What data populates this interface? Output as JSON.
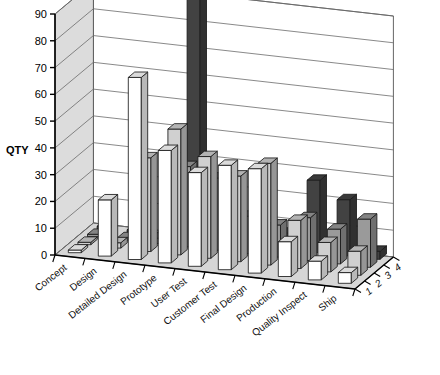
{
  "chart_data": {
    "type": "bar",
    "title": "",
    "subtitle": "",
    "xlabel": "",
    "ylabel": "QTY",
    "zlabel": "",
    "ylim": [
      0,
      90
    ],
    "ytick_step": 10,
    "yticks": [
      0,
      10,
      20,
      30,
      40,
      50,
      60,
      70,
      80,
      90
    ],
    "ytick_labels": [
      "0",
      "10",
      "20",
      "30",
      "40",
      "50",
      "60",
      "70",
      "80",
      "90"
    ],
    "grid": true,
    "legend_position": "none",
    "projection": "3d",
    "categories": [
      "Concept",
      "Design",
      "Detailed Design",
      "Prototype",
      "User Test",
      "Customer Test",
      "Final Design",
      "Production",
      "Quality Inspect",
      "Ship"
    ],
    "series_axis_labels": [
      "1",
      "2",
      "3",
      "4"
    ],
    "series": [
      {
        "name": "1",
        "color": "#ffffff",
        "values": [
          1,
          21,
          68,
          42,
          35,
          39,
          39,
          13,
          7,
          4
        ]
      },
      {
        "name": "2",
        "color": "#d0d0d0",
        "values": [
          0,
          2,
          35,
          47,
          38,
          32,
          38,
          18,
          11,
          9
        ]
      },
      {
        "name": "3",
        "color": "#9a9a9a",
        "values": [
          0,
          0,
          2,
          30,
          27,
          14,
          12,
          16,
          13,
          18
        ]
      },
      {
        "name": "4",
        "color": "#424242",
        "values": [
          0,
          0,
          0,
          90,
          24,
          9,
          6,
          27,
          21,
          3
        ]
      }
    ]
  },
  "axes": {
    "qty_title": "QTY"
  },
  "caption": {
    "text": ""
  },
  "icons": {
    "chart": "bar-chart-3d-icon"
  }
}
